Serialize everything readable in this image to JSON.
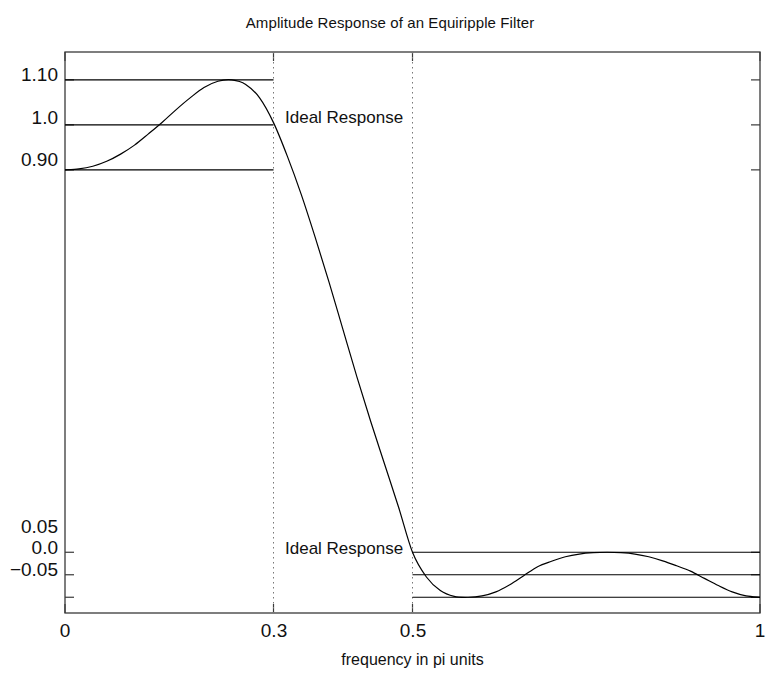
{
  "chart_data": {
    "type": "line",
    "title": "Amplitude Response of an Equiripple Filter",
    "xlabel": "frequency in pi units",
    "ylabel": "",
    "xlim": [
      0,
      1
    ],
    "ylim": [
      -0.085,
      1.162
    ],
    "grid": false,
    "legend": "none",
    "xticks": [
      {
        "value": 0,
        "label": "0"
      },
      {
        "value": 0.3,
        "label": "0.3"
      },
      {
        "value": 0.5,
        "label": "0.5"
      },
      {
        "value": 1,
        "label": "1"
      }
    ],
    "yticks": [
      {
        "value": 1.1,
        "label": "1.10"
      },
      {
        "value": 1.0,
        "label": "1.0"
      },
      {
        "value": 0.9,
        "label": "0.90"
      },
      {
        "value": 0.05,
        "label": "0.05"
      },
      {
        "value": 0.0,
        "label": "0.0"
      },
      {
        "value": -0.05,
        "label": "−0.05"
      }
    ],
    "annotations": [
      {
        "text": "Ideal Response",
        "x": 0.31,
        "y": 1.0,
        "band": "passband"
      },
      {
        "text": "Ideal Response",
        "x": 0.02,
        "y": 0.0,
        "band": "stopband"
      }
    ],
    "reference_lines": [
      {
        "value": 1.1,
        "x_from": 0.0,
        "x_to": 0.3,
        "style": "solid"
      },
      {
        "value": 1.0,
        "x_from": 0.0,
        "x_to": 0.3,
        "style": "solid"
      },
      {
        "value": 0.9,
        "x_from": 0.0,
        "x_to": 0.3,
        "style": "solid"
      },
      {
        "value": 0.05,
        "x_from": 0.5,
        "x_to": 1.0,
        "style": "solid"
      },
      {
        "value": 0.0,
        "x_from": 0.5,
        "x_to": 1.0,
        "style": "solid"
      },
      {
        "value": -0.05,
        "x_from": 0.5,
        "x_to": 1.0,
        "style": "solid"
      }
    ],
    "vertical_markers": [
      {
        "value": 0.3,
        "style": "dotted"
      },
      {
        "value": 0.5,
        "style": "dotted"
      }
    ],
    "series": [
      {
        "name": "Equiripple amplitude response",
        "color": "#000000",
        "x": [
          0.0,
          0.02,
          0.04,
          0.06,
          0.08,
          0.1,
          0.12,
          0.14,
          0.16,
          0.18,
          0.2,
          0.22,
          0.24,
          0.26,
          0.28,
          0.3,
          0.32,
          0.34,
          0.36,
          0.38,
          0.4,
          0.42,
          0.44,
          0.46,
          0.48,
          0.5,
          0.52,
          0.54,
          0.56,
          0.58,
          0.6,
          0.62,
          0.64,
          0.66,
          0.68,
          0.7,
          0.72,
          0.74,
          0.76,
          0.78,
          0.8,
          0.82,
          0.84,
          0.86,
          0.88,
          0.9,
          0.92,
          0.94,
          0.96,
          0.98,
          1.0
        ],
        "y": [
          0.9,
          0.902,
          0.908,
          0.919,
          0.935,
          0.955,
          0.98,
          1.006,
          1.034,
          1.06,
          1.083,
          1.097,
          1.1,
          1.09,
          1.06,
          1.005,
          0.93,
          0.845,
          0.75,
          0.65,
          0.545,
          0.44,
          0.34,
          0.245,
          0.15,
          0.05,
          -0.005,
          -0.035,
          -0.048,
          -0.05,
          -0.047,
          -0.038,
          -0.022,
          -0.002,
          0.018,
          0.03,
          0.04,
          0.046,
          0.049,
          0.05,
          0.049,
          0.046,
          0.04,
          0.031,
          0.02,
          0.008,
          -0.008,
          -0.024,
          -0.038,
          -0.047,
          -0.05
        ]
      }
    ]
  },
  "axes": {
    "frame_color": "#3a3a3a",
    "line_color": "#000000",
    "background": "#ffffff"
  }
}
